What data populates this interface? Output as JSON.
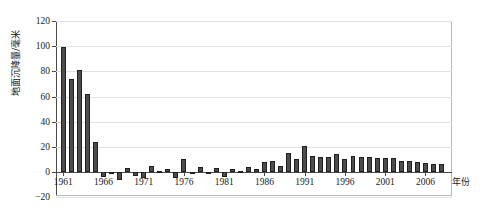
{
  "chart_data": {
    "type": "bar",
    "title": "",
    "xlabel": "年份",
    "ylabel": "地面沉降量/毫米",
    "ylim": [
      -20,
      120
    ],
    "yticks": [
      -20,
      0,
      20,
      40,
      60,
      80,
      100,
      120
    ],
    "ytick_labels": [
      "−20",
      "0",
      "20",
      "40",
      "60",
      "80",
      "100",
      "120"
    ],
    "xlim": [
      1960.5,
      2008.5
    ],
    "xticks": [
      1961,
      1966,
      1971,
      1976,
      1981,
      1986,
      1991,
      1996,
      2001,
      2006
    ],
    "xtick_labels": [
      "1961",
      "1966",
      "1971",
      "1976",
      "1981",
      "1986",
      "1991",
      "1996",
      "2001",
      "2006"
    ],
    "grid": true,
    "legend": "none",
    "bar_color": "#4d4d4d",
    "bar_edge_color": "#1f1f1f",
    "axis_color": "#4a4a4a",
    "grid_color": "#e2e2e2",
    "categories": [
      "1961",
      "1962",
      "1963",
      "1964",
      "1965",
      "1966",
      "1967",
      "1968",
      "1969",
      "1970",
      "1971",
      "1972",
      "1973",
      "1974",
      "1975",
      "1976",
      "1977",
      "1978",
      "1979",
      "1980",
      "1981",
      "1982",
      "1983",
      "1984",
      "1985",
      "1986",
      "1987",
      "1988",
      "1989",
      "1990",
      "1991",
      "1992",
      "1993",
      "1994",
      "1995",
      "1996",
      "1997",
      "1998",
      "1999",
      "2000",
      "2001",
      "2002",
      "2003",
      "2004",
      "2005",
      "2006",
      "2007",
      "2008"
    ],
    "values": [
      99,
      74,
      81,
      62,
      24,
      -4,
      0,
      -6,
      3,
      -3,
      -5,
      5,
      1,
      2,
      -5,
      10,
      0,
      4,
      -1,
      3,
      -4,
      2,
      1,
      4,
      2,
      8,
      9,
      5,
      15,
      10,
      21,
      13,
      12,
      12,
      14,
      10,
      13,
      12,
      12,
      11,
      11,
      11,
      9,
      9,
      8,
      7,
      6,
      6
    ]
  }
}
